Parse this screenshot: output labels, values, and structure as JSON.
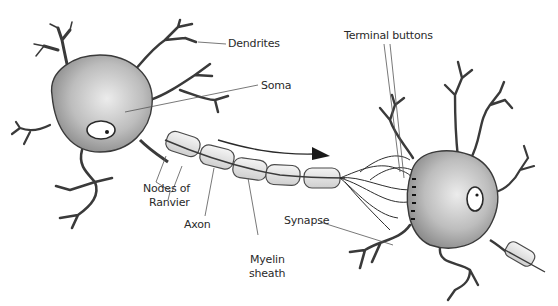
{
  "diagram": {
    "labels": {
      "dendrites": "Dendrites",
      "soma": "Soma",
      "nodes_of_ranvier_line1": "Nodes of",
      "nodes_of_ranvier_line2": "Ranvier",
      "axon": "Axon",
      "myelin_sheath_line1": "Myelin",
      "myelin_sheath_line2": "sheath",
      "terminal_buttons": "Terminal buttons",
      "synapse": "Synapse"
    },
    "colors": {
      "ink": "#2a2a2a",
      "soma_fill": "#a8a8a8",
      "soma_highlight": "#e6e6e6",
      "myelin_fill": "#e4e4e4",
      "leader_line": "#555555"
    },
    "signal_direction": "left-to-right"
  }
}
